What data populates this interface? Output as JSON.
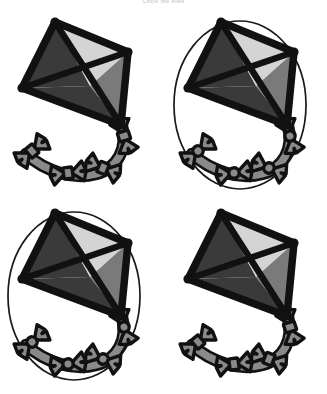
{
  "page": {
    "title": "Circle the kites",
    "background": "#ffffff",
    "width": 327,
    "height": 394
  },
  "palette": {
    "outline": "#111111",
    "quadrant_top_left": "#3a3a3a",
    "quadrant_top_right": "#d4d4d4",
    "quadrant_bottom_left": "#3a3a3a",
    "quadrant_bottom_right": "#7a7a7a",
    "bow_fill": "#8a8a8a",
    "circle_stroke": "#1a1a1a",
    "string": "#8a8a8a"
  },
  "items": [
    {
      "id": "kite-top-left",
      "label": "Kite top left",
      "circled": false,
      "tail_center_shape": "rectangle",
      "position": {
        "x": 0,
        "y": 8
      }
    },
    {
      "id": "kite-top-right",
      "label": "Kite top right",
      "circled": true,
      "tail_center_shape": "round",
      "position": {
        "x": 166,
        "y": 8
      }
    },
    {
      "id": "kite-bottom-left",
      "label": "Kite bottom left",
      "circled": true,
      "tail_center_shape": "round",
      "position": {
        "x": 0,
        "y": 199
      }
    },
    {
      "id": "kite-bottom-right",
      "label": "Kite bottom right",
      "circled": false,
      "tail_center_shape": "rectangle",
      "position": {
        "x": 166,
        "y": 199
      }
    }
  ]
}
